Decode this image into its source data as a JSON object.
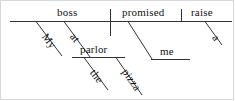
{
  "diagram": {
    "type": "reed-kellogg-sentence-diagram",
    "sentence": "My boss at the pizza parlor promised me a raise.",
    "words": {
      "subject": "boss",
      "verb": "promised",
      "direct_object": "raise",
      "indirect_object": "me",
      "preposition": "at",
      "prep_object": "parlor",
      "mod_subject": "My",
      "mod_parlor_article": "the",
      "mod_parlor_noun": "pizza",
      "mod_raise_article": "a"
    },
    "lines": {
      "baseline": {
        "x1": 10,
        "y1": 21,
        "x2": 232,
        "y2": 21
      },
      "subject_verb_divider": {
        "x1": 110,
        "y1": 9,
        "x2": 110,
        "y2": 36
      },
      "verb_object_divider": {
        "x1": 181,
        "y1": 9,
        "x2": 181,
        "y2": 21
      },
      "my_diagonal": {
        "x1": 36,
        "y1": 21,
        "x2": 62,
        "y2": 56
      },
      "at_diagonal": {
        "x1": 64,
        "y1": 21,
        "x2": 90,
        "y2": 57
      },
      "prep_horizontal": {
        "x1": 72,
        "y1": 57,
        "x2": 125,
        "y2": 57
      },
      "the_diagonal": {
        "x1": 84,
        "y1": 57,
        "x2": 108,
        "y2": 90
      },
      "pizza_diagonal": {
        "x1": 116,
        "y1": 57,
        "x2": 142,
        "y2": 95
      },
      "me_diagonal": {
        "x1": 128,
        "y1": 21,
        "x2": 152,
        "y2": 59
      },
      "me_horizontal": {
        "x1": 152,
        "y1": 59,
        "x2": 190,
        "y2": 59
      },
      "a_diagonal": {
        "x1": 205,
        "y1": 21,
        "x2": 222,
        "y2": 45
      }
    },
    "colors": {
      "ink": "#333333",
      "text": "#111111",
      "background": "#ffffff",
      "frame": "#d8d8d8"
    }
  }
}
